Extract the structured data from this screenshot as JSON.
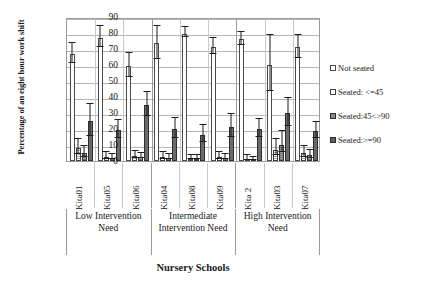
{
  "chart_data": {
    "type": "bar",
    "title": "",
    "xlabel": "Nursery Schools",
    "ylabel": "Percentage of an eight hour work shift",
    "ylim": [
      0,
      90
    ],
    "yticks": [
      0,
      10,
      20,
      30,
      40,
      50,
      60,
      70,
      80,
      90
    ],
    "grid": true,
    "legend_position": "right",
    "categories": [
      "Kita01",
      "Kita05",
      "Kita06",
      "Kita04",
      "Kita08",
      "Kita09",
      "Kita 2",
      "Kita03",
      "Kita07"
    ],
    "groups": [
      {
        "label": "Low Intervention Need",
        "categories": [
          "Kita01",
          "Kita05",
          "Kita06"
        ]
      },
      {
        "label": "Intermediate Intervention Need",
        "categories": [
          "Kita04",
          "Kita08",
          "Kita09"
        ]
      },
      {
        "label": "High Intervention Need",
        "categories": [
          "Kita 2",
          "Kita03",
          "Kita07"
        ]
      }
    ],
    "series": [
      {
        "name": "Not seated",
        "values": [
          67,
          77,
          59.5,
          73.5,
          79.5,
          71.5,
          76,
          60,
          71
        ],
        "err_low": [
          6.5,
          6.5,
          7.5,
          10.5,
          2.5,
          5,
          4,
          17,
          7
        ],
        "err_high": [
          6,
          6.5,
          7.5,
          10.5,
          3.5,
          5,
          4,
          18,
          7
        ]
      },
      {
        "name": "Seated: <=45",
        "values": [
          8,
          2.5,
          3,
          2.5,
          1.5,
          2.5,
          1.5,
          7,
          5
        ],
        "err_low": [
          4,
          2,
          2,
          2,
          1,
          2,
          1.5,
          4,
          3
        ],
        "err_high": [
          5,
          2.5,
          2.5,
          2.5,
          1.5,
          2.5,
          1.5,
          6,
          3.5
        ]
      },
      {
        "name": "Seated:45<>90",
        "values": [
          5,
          2,
          2.5,
          2,
          1.5,
          2,
          1,
          10,
          3.5
        ],
        "err_low": [
          3,
          1.5,
          1.5,
          1.5,
          1,
          1.5,
          1,
          5,
          2
        ],
        "err_high": [
          3.5,
          2,
          2,
          2,
          1.5,
          2,
          1,
          8,
          2.5
        ]
      },
      {
        "name": "Seated:>=90",
        "values": [
          25,
          19.5,
          35,
          20,
          16.5,
          21.5,
          20,
          30,
          18.5
        ],
        "err_low": [
          10,
          5.5,
          7.5,
          6.5,
          5.5,
          7,
          5.5,
          8.5,
          5
        ]
      }
    ]
  },
  "legend": {
    "items": [
      {
        "label": "Not seated"
      },
      {
        "label": "Seated: <=45"
      },
      {
        "label": "Seated:45<>90"
      },
      {
        "label": "Seated:>=90"
      }
    ]
  }
}
